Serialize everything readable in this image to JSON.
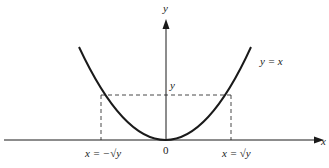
{
  "diagram": {
    "axes": {
      "x_label": "x",
      "y_label": "y",
      "origin_label": "0"
    },
    "curve": {
      "label": "y = x",
      "shape": "parabola"
    },
    "markers": {
      "level_label": "y",
      "left_label": "x = −√y",
      "right_label": "x = √y"
    },
    "colors": {
      "stroke": "#1a1a1a",
      "background": "#ffffff"
    }
  }
}
